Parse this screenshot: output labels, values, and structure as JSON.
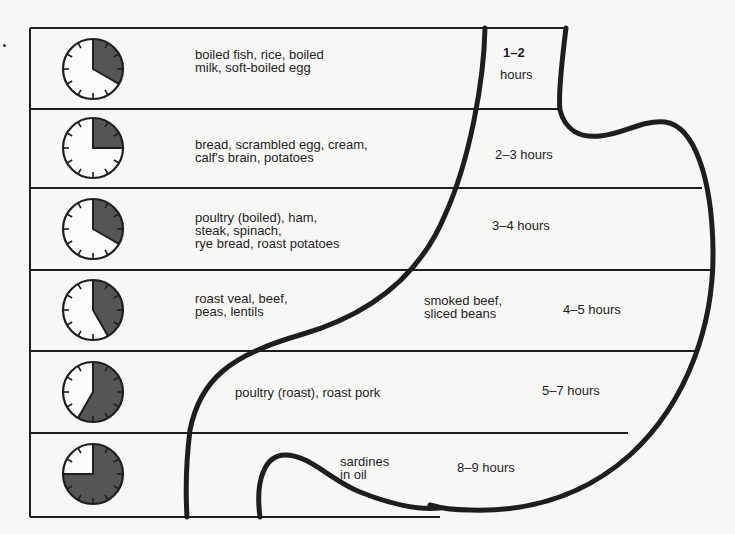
{
  "colors": {
    "ink": "#1e1e1e",
    "shade": "#555555",
    "paper": "#f7f7f5"
  },
  "rows": [
    {
      "foods": "boiled fish, rice, boiled\nmilk, soft-boiled egg",
      "extra": "",
      "time_range": "1–2",
      "time_unit": "hours",
      "clock_fill_minutes": 20,
      "clock_icon": "clock-1-2-hours-icon"
    },
    {
      "foods": "bread, scrambled egg, cream,\ncalf's brain, potatoes",
      "extra": "",
      "time_label": "2–3 hours",
      "clock_fill_minutes": 15,
      "clock_icon": "clock-2-3-hours-icon"
    },
    {
      "foods": "poultry (boiled), ham,\nsteak, spinach,\nrye bread, roast potatoes",
      "extra": "",
      "time_label": "3–4  hours",
      "clock_fill_minutes": 20,
      "clock_icon": "clock-3-4-hours-icon"
    },
    {
      "foods": "roast veal, beef,\npeas, lentils",
      "extra": "smoked beef,\nsliced beans",
      "time_label": "4–5 hours",
      "clock_fill_minutes": 25,
      "clock_icon": "clock-4-5-hours-icon"
    },
    {
      "foods": "poultry (roast),  roast pork",
      "extra": "",
      "time_label": "5–7 hours",
      "clock_fill_minutes": 35,
      "clock_icon": "clock-5-7-hours-icon"
    },
    {
      "foods": "sardines\nin oil",
      "extra": "",
      "time_label": "8–9 hours",
      "clock_fill_minutes": 45,
      "clock_icon": "clock-8-9-hours-icon"
    }
  ]
}
